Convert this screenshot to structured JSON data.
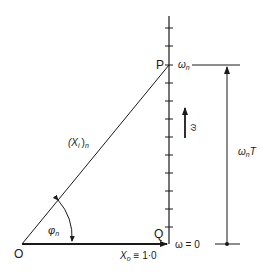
{
  "diagram": {
    "points": {
      "origin": "O",
      "top": "P",
      "base": "Q"
    },
    "labels": {
      "hypotenuse_main": "(X",
      "hypotenuse_sub": "i",
      "hypotenuse_close": ")",
      "hypotenuse_n": "n",
      "angle_main": "φ",
      "angle_sub": "n",
      "base_main": "X",
      "base_sub": "o",
      "base_value": "≡ 1·0",
      "omega_n_main": "ω",
      "omega_n_sub": "n",
      "omega_zero": "ω = 0",
      "omega_arrow": "ω",
      "dimension_main": "ω",
      "dimension_sub": "n",
      "dimension_T": "T"
    },
    "axis": {
      "tick_count": 13
    }
  }
}
